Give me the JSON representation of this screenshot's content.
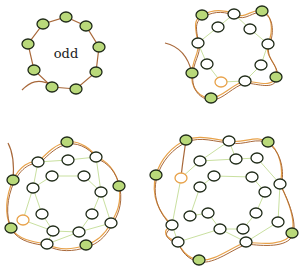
{
  "colors": {
    "bead_green": "#b9d97a",
    "bead_white": "#ffffff",
    "bead_stroke": "#1f2a18",
    "bead_orange_stroke": "#e8a24a",
    "thread_brown": "#a8683a",
    "thread_orange": "#e8a24a",
    "thread_green": "#c9e0a0"
  },
  "panels": [
    {
      "id": "panel-odd-ring",
      "label": "odd",
      "outer": {
        "green": [
          [
            66,
            17
          ],
          [
            86,
            26
          ],
          [
            99,
            47
          ],
          [
            96,
            72
          ],
          [
            76,
            89
          ],
          [
            52,
            87
          ],
          [
            34,
            70
          ],
          [
            28,
            44
          ],
          [
            43,
            24
          ]
        ]
      },
      "tail": "M22,90 C30,82 38,78 52,85"
    },
    {
      "id": "panel-step-2",
      "outer_path": "M202,15 C215,8 225,10 234,14 C245,20 252,8 262,11 C272,14 274,30 268,44 C264,58 280,64 276,77 C272,88 258,82 245,81 C232,84 222,98 211,98 C200,98 190,88 192,73 C192,60 200,52 198,43 C196,30 192,20 202,15 Z",
      "tail": "M165,43 C178,46 188,56 192,73",
      "green": [
        [
          202,
          15
        ],
        [
          262,
          11
        ],
        [
          276,
          77
        ],
        [
          211,
          98
        ],
        [
          192,
          73
        ]
      ],
      "white": [
        [
          234,
          14
        ],
        [
          218,
          27
        ],
        [
          250,
          29
        ],
        [
          198,
          43
        ],
        [
          268,
          44
        ],
        [
          207,
          64
        ],
        [
          261,
          65
        ],
        [
          245,
          81
        ]
      ],
      "orange": [
        [
          221,
          82
        ]
      ],
      "inner_lines": [
        [
          [
            218,
            27
          ],
          [
            234,
            14
          ]
        ],
        [
          [
            234,
            14
          ],
          [
            250,
            29
          ]
        ],
        [
          [
            250,
            29
          ],
          [
            268,
            44
          ]
        ],
        [
          [
            268,
            44
          ],
          [
            261,
            65
          ]
        ],
        [
          [
            261,
            65
          ],
          [
            245,
            81
          ]
        ],
        [
          [
            245,
            81
          ],
          [
            221,
            82
          ]
        ],
        [
          [
            221,
            82
          ],
          [
            207,
            64
          ]
        ],
        [
          [
            207,
            64
          ],
          [
            198,
            43
          ]
        ],
        [
          [
            198,
            43
          ],
          [
            218,
            27
          ]
        ]
      ]
    },
    {
      "id": "panel-step-3",
      "outer_path": "M67,142 C80,140 92,150 96,157 C106,160 116,170 119,186 C122,204 116,214 111,223 C104,236 96,242 86,245 C72,250 58,250 47,244 C34,242 18,240 11,228 C4,214 6,196 13,180 C20,166 30,160 38,162 C48,152 56,144 67,142 Z",
      "tail": "M8,143 C14,154 14,168 13,180",
      "green": [
        [
          67,
          142
        ],
        [
          13,
          180
        ],
        [
          119,
          186
        ],
        [
          11,
          228
        ],
        [
          86,
          245
        ]
      ],
      "white": [
        [
          38,
          162
        ],
        [
          68,
          160
        ],
        [
          96,
          157
        ],
        [
          52,
          176
        ],
        [
          84,
          176
        ],
        [
          33,
          188
        ],
        [
          101,
          192
        ],
        [
          42,
          214
        ],
        [
          92,
          214
        ],
        [
          53,
          231
        ],
        [
          79,
          232
        ],
        [
          111,
          223
        ],
        [
          47,
          244
        ]
      ],
      "orange": [
        [
          23,
          220
        ]
      ],
      "inner_lines": [
        [
          [
            38,
            162
          ],
          [
            68,
            160
          ]
        ],
        [
          [
            68,
            160
          ],
          [
            96,
            157
          ]
        ],
        [
          [
            96,
            157
          ],
          [
            101,
            192
          ]
        ],
        [
          [
            101,
            192
          ],
          [
            111,
            223
          ]
        ],
        [
          [
            111,
            223
          ],
          [
            79,
            232
          ]
        ],
        [
          [
            79,
            232
          ],
          [
            53,
            231
          ]
        ],
        [
          [
            53,
            231
          ],
          [
            23,
            220
          ]
        ],
        [
          [
            23,
            220
          ],
          [
            33,
            188
          ]
        ],
        [
          [
            33,
            188
          ],
          [
            38,
            162
          ]
        ],
        [
          [
            52,
            176
          ],
          [
            84,
            176
          ]
        ],
        [
          [
            84,
            176
          ],
          [
            101,
            192
          ]
        ],
        [
          [
            101,
            192
          ],
          [
            92,
            214
          ]
        ],
        [
          [
            92,
            214
          ],
          [
            79,
            232
          ]
        ],
        [
          [
            53,
            231
          ],
          [
            42,
            214
          ]
        ],
        [
          [
            42,
            214
          ],
          [
            33,
            188
          ]
        ],
        [
          [
            33,
            188
          ],
          [
            52,
            176
          ]
        ],
        [
          [
            47,
            244
          ],
          [
            53,
            231
          ]
        ],
        [
          [
            47,
            244
          ],
          [
            79,
            232
          ]
        ]
      ]
    },
    {
      "id": "panel-step-4",
      "outer_path": "M186,140 C200,134 214,140 229,141 C244,144 256,134 268,142 C280,150 284,170 280,184 C288,200 296,220 292,233 C286,246 262,244 246,242 C230,248 214,262 199,260 C186,258 180,248 178,242 C166,238 160,232 172,225 C160,214 150,196 156,175 C160,160 172,146 186,140 Z",
      "tail": "M186,140 C184,154 182,166 181,178",
      "green": [
        [
          186,
          140
        ],
        [
          268,
          142
        ],
        [
          156,
          175
        ],
        [
          292,
          233
        ],
        [
          199,
          260
        ]
      ],
      "white": [
        [
          229,
          141
        ],
        [
          200,
          161
        ],
        [
          236,
          159
        ],
        [
          257,
          158
        ],
        [
          214,
          176
        ],
        [
          252,
          177
        ],
        [
          280,
          184
        ],
        [
          200,
          187
        ],
        [
          265,
          192
        ],
        [
          208,
          213
        ],
        [
          256,
          213
        ],
        [
          190,
          216
        ],
        [
          278,
          222
        ],
        [
          172,
          225
        ],
        [
          220,
          229
        ],
        [
          243,
          229
        ],
        [
          178,
          242
        ],
        [
          246,
          242
        ]
      ],
      "orange": [
        [
          181,
          178
        ]
      ],
      "inner_lines": [
        [
          [
            200,
            161
          ],
          [
            236,
            159
          ]
        ],
        [
          [
            236,
            159
          ],
          [
            257,
            158
          ]
        ],
        [
          [
            257,
            158
          ],
          [
            280,
            184
          ]
        ],
        [
          [
            280,
            184
          ],
          [
            278,
            222
          ]
        ],
        [
          [
            278,
            222
          ],
          [
            246,
            242
          ]
        ],
        [
          [
            246,
            242
          ],
          [
            220,
            229
          ]
        ],
        [
          [
            220,
            229
          ],
          [
            178,
            242
          ]
        ],
        [
          [
            178,
            242
          ],
          [
            172,
            225
          ]
        ],
        [
          [
            172,
            225
          ],
          [
            181,
            178
          ]
        ],
        [
          [
            181,
            178
          ],
          [
            200,
            161
          ]
        ],
        [
          [
            214,
            176
          ],
          [
            252,
            177
          ]
        ],
        [
          [
            252,
            177
          ],
          [
            265,
            192
          ]
        ],
        [
          [
            265,
            192
          ],
          [
            256,
            213
          ]
        ],
        [
          [
            256,
            213
          ],
          [
            243,
            229
          ]
        ],
        [
          [
            243,
            229
          ],
          [
            220,
            229
          ]
        ],
        [
          [
            208,
            213
          ],
          [
            190,
            216
          ]
        ],
        [
          [
            190,
            216
          ],
          [
            200,
            187
          ]
        ],
        [
          [
            200,
            187
          ],
          [
            214,
            176
          ]
        ],
        [
          [
            229,
            141
          ],
          [
            236,
            159
          ]
        ],
        [
          [
            229,
            141
          ],
          [
            200,
            161
          ]
        ],
        [
          [
            208,
            213
          ],
          [
            220,
            229
          ]
        ]
      ]
    }
  ]
}
